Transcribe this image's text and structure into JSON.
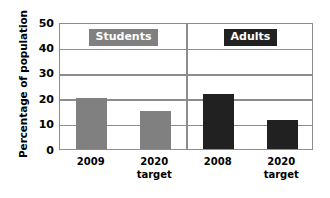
{
  "chart_data": {
    "type": "bar",
    "title": "",
    "xlabel": "",
    "ylabel": "Percentage of population",
    "ylim": [
      0,
      50
    ],
    "ytick_values": [
      50,
      40,
      30,
      20,
      10,
      0
    ],
    "ytick_labels": [
      "50",
      "40",
      "30",
      "20",
      "10",
      "0"
    ],
    "grid": true,
    "legend_position": "inside-top",
    "groups": [
      {
        "name": "Students",
        "badge_label": "Students",
        "color": "#808080",
        "categories": [
          "2009",
          "2020 target"
        ],
        "values": [
          20,
          15
        ],
        "bars": [
          {
            "label_line1": "2009",
            "label_line2": "",
            "value": 20
          },
          {
            "label_line1": "2020",
            "label_line2": "target",
            "value": 15
          }
        ]
      },
      {
        "name": "Adults",
        "badge_label": "Adults",
        "color": "#212121",
        "categories": [
          "2008",
          "2020 target"
        ],
        "values": [
          21.5,
          11.5
        ],
        "bars": [
          {
            "label_line1": "2008",
            "label_line2": "",
            "value": 21.5
          },
          {
            "label_line1": "2020",
            "label_line2": "target",
            "value": 11.5
          }
        ]
      }
    ],
    "colors": {
      "students_bar": "#808080",
      "adults_bar": "#212121",
      "frame": "#8c8c8c",
      "background": "#ffffff",
      "text": "#000000",
      "badge_text": "#ffffff"
    }
  }
}
